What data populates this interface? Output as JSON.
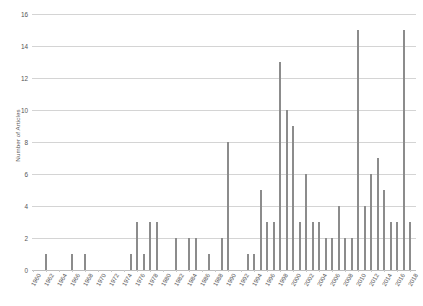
{
  "chart_data": {
    "type": "bar",
    "title": "",
    "xlabel": "",
    "ylabel": "Number of Articles",
    "ylim": [
      0,
      16
    ],
    "ytick_values": [
      0,
      2,
      4,
      6,
      8,
      10,
      12,
      14,
      16
    ],
    "ytick_labels": [
      "0",
      "2",
      "4",
      "6",
      "8",
      "10",
      "12",
      "14",
      "16"
    ],
    "xlim": [
      1960,
      2019
    ],
    "xtick_labels": [
      "1960",
      "1962",
      "1964",
      "1966",
      "1968",
      "1970",
      "1972",
      "1974",
      "1976",
      "1978",
      "1980",
      "1982",
      "1984",
      "1986",
      "1988",
      "1990",
      "1992",
      "1994",
      "1996",
      "1998",
      "2000",
      "2002",
      "2004",
      "2006",
      "2008",
      "2010",
      "2012",
      "2014",
      "2016",
      "2018"
    ],
    "grid": "horizontal",
    "legend": "none",
    "bar_color": "#8c8c8c",
    "grid_color": "#d4d4d4",
    "categories": [
      1960,
      1961,
      1962,
      1963,
      1964,
      1965,
      1966,
      1967,
      1968,
      1969,
      1970,
      1971,
      1972,
      1973,
      1974,
      1975,
      1976,
      1977,
      1978,
      1979,
      1980,
      1981,
      1982,
      1983,
      1984,
      1985,
      1986,
      1987,
      1988,
      1989,
      1990,
      1991,
      1992,
      1993,
      1994,
      1995,
      1996,
      1997,
      1998,
      1999,
      2000,
      2001,
      2002,
      2003,
      2004,
      2005,
      2006,
      2007,
      2008,
      2009,
      2010,
      2011,
      2012,
      2013,
      2014,
      2015,
      2016,
      2017,
      2018
    ],
    "values": [
      0,
      0,
      1,
      0,
      0,
      0,
      1,
      0,
      1,
      0,
      0,
      0,
      0,
      0,
      0,
      1,
      3,
      1,
      3,
      3,
      0,
      0,
      2,
      0,
      2,
      2,
      0,
      1,
      0,
      2,
      8,
      0,
      0,
      1,
      1,
      5,
      3,
      3,
      13,
      10,
      9,
      3,
      6,
      3,
      3,
      2,
      2,
      4,
      2,
      2,
      15,
      4,
      6,
      7,
      5,
      3,
      3,
      15,
      3
    ]
  },
  "axis": {
    "y_title": "Number of Articles"
  }
}
